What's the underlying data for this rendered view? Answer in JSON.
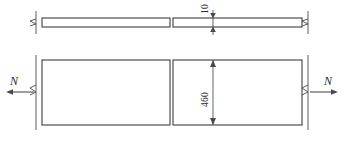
{
  "drawing": {
    "title": "Plate under axial tension - plan and elevation",
    "background_color": "#ffffff",
    "line_color": "#3c3c3c",
    "dimension_color": "#4a4a4a",
    "text_color": "#2b2b2b",
    "dimensions": [
      {
        "id": "thickness",
        "value": "10",
        "orientation": "vertical-rotated",
        "view": "elevation-top",
        "description": "plate thickness dimension on upper strip"
      },
      {
        "id": "width",
        "value": "460",
        "orientation": "vertical-rotated",
        "view": "plan-bottom",
        "description": "plate width dimension on lower rectangle"
      }
    ],
    "force_labels": [
      {
        "id": "force-left",
        "value": "N",
        "direction": "left",
        "description": "axial tension force arrow pointing left"
      },
      {
        "id": "force-right",
        "value": "N",
        "direction": "right",
        "description": "axial tension force arrow pointing right"
      }
    ],
    "views": {
      "elevation": {
        "name": "elevation",
        "description": "thin horizontal strip shown in two segments"
      },
      "plan": {
        "name": "plan",
        "description": "wide rectangle shown in two segments"
      }
    },
    "break_symbols": {
      "count": 4,
      "description": "zigzag break marks indicating truncated length"
    }
  }
}
